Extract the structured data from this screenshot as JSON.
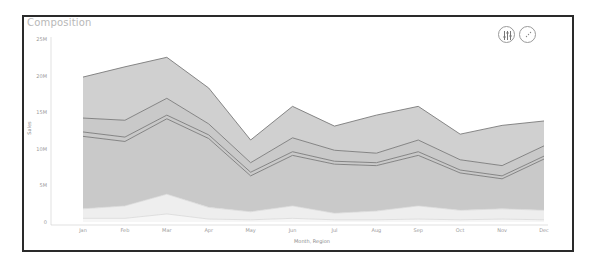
{
  "card": {
    "title": "Composition",
    "buttons": [
      {
        "name": "filter-settings-button",
        "icon": "sliders-icon"
      },
      {
        "name": "more-options-button",
        "icon": "dots-circle-icon"
      }
    ]
  },
  "colors": {
    "band_top": "#d0d0d0",
    "band_mid": "#c9c9c9",
    "band_low": "#eeeeee",
    "band_bottom": "#f6f6f6",
    "line": "#7a7a7a",
    "axis": "#cccccc"
  },
  "chart_data": {
    "type": "area",
    "title": "Composition",
    "xlabel": "Month, Region",
    "ylabel": "Sales",
    "ylim": [
      0,
      25000000
    ],
    "yticks": [
      "0",
      "5M",
      "10M",
      "15M",
      "20M",
      "25M"
    ],
    "categories": [
      "Jan",
      "Feb",
      "Mar",
      "Apr",
      "May",
      "Jun",
      "Jul",
      "Aug",
      "Sep",
      "Oct",
      "Nov",
      "Dec"
    ],
    "stacked": true,
    "series_cumulative_note": "values below are cumulative top edges of each stacked layer, in millions",
    "series": [
      {
        "name": "Layer 1 (bottom)",
        "values": [
          0.5,
          0.5,
          1.1,
          0.4,
          0.3,
          0.5,
          0.3,
          0.3,
          0.4,
          0.3,
          0.4,
          0.3
        ]
      },
      {
        "name": "Layer 2",
        "values": [
          1.8,
          2.2,
          3.8,
          2.0,
          1.4,
          2.2,
          1.2,
          1.5,
          2.2,
          1.6,
          1.8,
          1.6
        ]
      },
      {
        "name": "Layer 3",
        "values": [
          11.7,
          11.0,
          14.1,
          11.4,
          6.3,
          9.1,
          7.9,
          7.7,
          9.1,
          6.7,
          5.9,
          8.6
        ]
      },
      {
        "name": "Layer 4",
        "values": [
          12.3,
          11.6,
          14.6,
          11.9,
          6.8,
          9.6,
          8.3,
          8.1,
          9.6,
          7.1,
          6.3,
          9.0
        ]
      },
      {
        "name": "Layer 5",
        "values": [
          14.2,
          13.9,
          16.9,
          13.4,
          8.1,
          11.5,
          9.8,
          9.4,
          11.2,
          8.5,
          7.7,
          10.4
        ]
      },
      {
        "name": "Layer 6 (total)",
        "values": [
          19.8,
          21.2,
          22.5,
          18.3,
          11.2,
          15.8,
          13.1,
          14.6,
          15.8,
          12.0,
          13.2,
          13.8
        ]
      }
    ],
    "grid": false,
    "legend": "none"
  }
}
